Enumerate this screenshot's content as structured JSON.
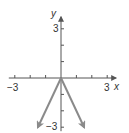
{
  "chart_data": {
    "type": "line",
    "title": "",
    "function": "y = -2|x|",
    "xlabel": "x",
    "ylabel": "y",
    "xlim": [
      -3,
      3
    ],
    "ylim": [
      -3,
      3
    ],
    "x_ticks": [
      -3,
      -2,
      -1,
      0,
      1,
      2,
      3
    ],
    "y_ticks": [
      -3,
      -2,
      -1,
      0,
      1,
      2,
      3
    ],
    "x_tick_labels": [
      {
        "value": -3,
        "text": "−3"
      },
      {
        "value": 3,
        "text": "3"
      }
    ],
    "y_tick_labels": [
      {
        "value": 3,
        "text": "3"
      },
      {
        "value": -3,
        "text": "−3"
      }
    ],
    "grid": false,
    "series": [
      {
        "name": "left-branch",
        "x": [
          0,
          -1.5
        ],
        "y": [
          0,
          -3
        ],
        "arrow_end": true
      },
      {
        "name": "right-branch",
        "x": [
          0,
          1.5
        ],
        "y": [
          0,
          -3
        ],
        "arrow_end": true
      }
    ],
    "colors": {
      "axis": "#555555",
      "curve": "#8a8a8a",
      "text": "#333333"
    }
  }
}
